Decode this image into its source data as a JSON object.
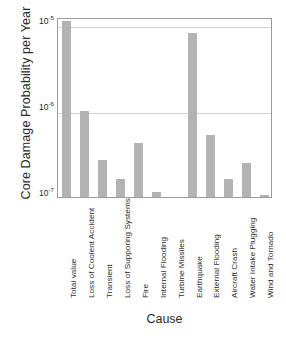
{
  "chart_data": {
    "type": "bar",
    "title": "",
    "xlabel": "Cause",
    "ylabel": "Core Damage Probability per Year",
    "yscale": "log",
    "ylim": [
      1e-07,
      1.3e-05
    ],
    "grid": true,
    "legend": "none",
    "ytick_labels": [
      "10-5",
      "10-6",
      "10-7"
    ],
    "ytick_mantissas": [
      "10",
      "10",
      "10"
    ],
    "ytick_exponents": [
      "-5",
      "-6",
      "-7"
    ],
    "ytick_values": [
      1e-05,
      1e-06,
      1e-07
    ],
    "categories": [
      "Total value",
      "Loss of Coolent Accident",
      "Transient",
      "Loss of Supporing Systems",
      "Fire",
      "Internal Flooding",
      "Turbine Missiles",
      "Earthquake",
      "External Flooding",
      "Aircraft Crash",
      "Water Intake Plugging",
      "Wind and Tornado"
    ],
    "values": [
      1.1e-05,
      1e-06,
      2.7e-07,
      1.6e-07,
      4.3e-07,
      1.15e-07,
      0,
      8e-06,
      5.3e-07,
      1.6e-07,
      2.5e-07,
      1.05e-07
    ],
    "bar_color": "#b3b3b3"
  }
}
